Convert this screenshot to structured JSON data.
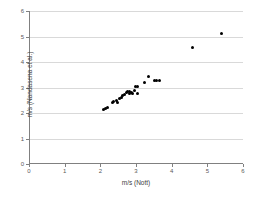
{
  "chart_data": {
    "type": "scatter",
    "title": "",
    "xlabel": "m/s (Nott)",
    "ylabel": "m/s (Nandasena et al.)",
    "xlim": [
      0,
      6
    ],
    "ylim": [
      0,
      6
    ],
    "xticks": [
      0,
      1,
      2,
      3,
      4,
      5,
      6
    ],
    "yticks": [
      0,
      1,
      2,
      3,
      4,
      5,
      6
    ],
    "grid": "horizontal",
    "legend": "none",
    "marker": "filled-circle",
    "marker_color": "#000000",
    "series": [
      {
        "name": "velocity comparison",
        "points": [
          [
            2.05,
            2.15
          ],
          [
            2.12,
            2.18
          ],
          [
            2.18,
            2.22
          ],
          [
            2.3,
            2.42
          ],
          [
            2.35,
            2.45
          ],
          [
            2.42,
            2.48
          ],
          [
            2.46,
            2.4
          ],
          [
            2.52,
            2.58
          ],
          [
            2.56,
            2.62
          ],
          [
            2.6,
            2.7
          ],
          [
            2.64,
            2.72
          ],
          [
            2.7,
            2.8
          ],
          [
            2.74,
            2.84
          ],
          [
            2.78,
            2.86
          ],
          [
            2.8,
            2.76
          ],
          [
            2.84,
            2.8
          ],
          [
            2.88,
            2.78
          ],
          [
            2.92,
            2.9
          ],
          [
            2.96,
            3.02
          ],
          [
            3.0,
            3.05
          ],
          [
            3.02,
            2.76
          ],
          [
            3.2,
            3.2
          ],
          [
            3.33,
            3.42
          ],
          [
            3.48,
            3.26
          ],
          [
            3.56,
            3.26
          ],
          [
            3.62,
            3.26
          ],
          [
            4.57,
            4.56
          ],
          [
            5.37,
            5.1
          ]
        ]
      }
    ]
  },
  "axis": {
    "x_tick_labels": [
      "0",
      "1",
      "2",
      "3",
      "4",
      "5",
      "6"
    ],
    "y_tick_labels": [
      "0",
      "1",
      "2",
      "3",
      "4",
      "5",
      "6"
    ]
  }
}
